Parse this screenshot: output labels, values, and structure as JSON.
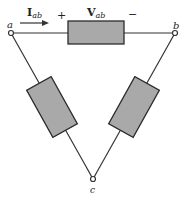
{
  "diagram": {
    "type": "delta resistor network",
    "nodes": [
      {
        "id": "a",
        "label": "a"
      },
      {
        "id": "b",
        "label": "b"
      },
      {
        "id": "c",
        "label": "c"
      }
    ],
    "current_label": {
      "main": "I",
      "sub": "ab"
    },
    "voltage_label": {
      "main": "V",
      "sub": "ab"
    },
    "polarity": {
      "plus": "+",
      "minus": "−"
    },
    "colors": {
      "resistor_fill": "#a9a9a9",
      "wire": "#333333",
      "background": "#ffffff"
    }
  }
}
